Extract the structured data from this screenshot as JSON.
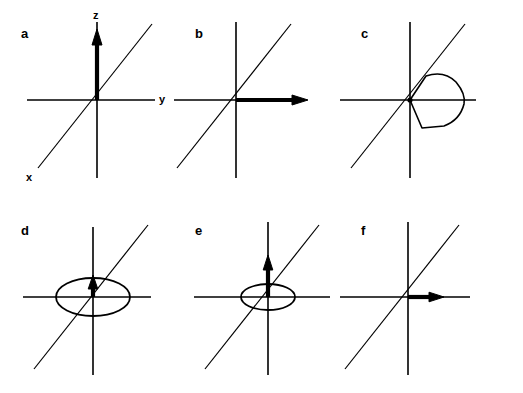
{
  "figure": {
    "background_color": "#ffffff",
    "stroke_color": "#000000",
    "panel_count": 6,
    "grid": {
      "rows": 2,
      "columns": 3
    }
  },
  "axes": {
    "z_label": "z",
    "y_label": "y",
    "x_label": "x",
    "description": "Right-handed 3D coordinate frame drawn in oblique projection: z vertical, y horizontal to the right, x diagonal toward lower-left."
  },
  "panels": [
    {
      "id": "a",
      "letter": "a",
      "row": 0,
      "column": 0,
      "has_axis_labels": true,
      "vector": {
        "name": "z-vector",
        "direction": "+z",
        "length_px": 68,
        "thickness_px": 4
      },
      "ellipse": null,
      "lobe": null
    },
    {
      "id": "b",
      "letter": "b",
      "row": 0,
      "column": 1,
      "has_axis_labels": false,
      "vector": {
        "name": "y-vector",
        "direction": "+y",
        "length_px": 72,
        "thickness_px": 4
      },
      "ellipse": null,
      "lobe": null
    },
    {
      "id": "c",
      "letter": "c",
      "row": 0,
      "column": 2,
      "has_axis_labels": false,
      "vector": null,
      "ellipse": null,
      "lobe": {
        "name": "orbital-lobe",
        "direction": "+y",
        "extent_px": 48,
        "half_height_px": 26
      }
    },
    {
      "id": "d",
      "letter": "d",
      "row": 1,
      "column": 0,
      "has_axis_labels": false,
      "vector": {
        "name": "z-vector",
        "direction": "+z",
        "length_px": 20,
        "thickness_px": 4
      },
      "ellipse": {
        "name": "precession-ellipse",
        "width_px": 74,
        "height_px": 38
      },
      "lobe": null
    },
    {
      "id": "e",
      "letter": "e",
      "row": 1,
      "column": 1,
      "has_axis_labels": false,
      "vector": {
        "name": "z-vector",
        "direction": "+z",
        "length_px": 42,
        "thickness_px": 4
      },
      "ellipse": {
        "name": "precession-ellipse",
        "width_px": 54,
        "height_px": 26
      },
      "lobe": null
    },
    {
      "id": "f",
      "letter": "f",
      "row": 1,
      "column": 2,
      "has_axis_labels": false,
      "vector": {
        "name": "y-vector",
        "direction": "+y",
        "length_px": 38,
        "thickness_px": 4
      },
      "ellipse": null,
      "lobe": null
    }
  ]
}
